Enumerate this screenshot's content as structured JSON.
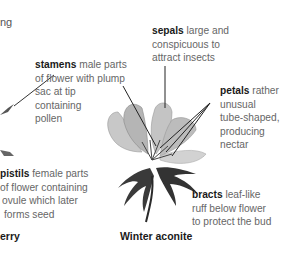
{
  "fragment_left_top": "ng",
  "labels": {
    "stamens": {
      "term": "stamens",
      "desc_lines": [
        " male parts",
        "of flower with plump",
        "sac at tip",
        "containing",
        "pollen"
      ]
    },
    "sepals": {
      "term": "sepals",
      "desc_lines": [
        " large and",
        "conspicuous to",
        "attract insects"
      ]
    },
    "petals": {
      "term": "petals",
      "desc_lines": [
        " rather",
        "unusual",
        "tube-shaped,",
        "producing",
        "nectar"
      ]
    },
    "pistils": {
      "term": "pistils",
      "desc_lines": [
        " female parts",
        "of flower containing",
        "ovule which later",
        "forms seed"
      ]
    },
    "bracts": {
      "term": "bracts",
      "desc_lines": [
        " leaf-like",
        "ruff below flower",
        "to protect the bud"
      ]
    }
  },
  "captions": {
    "left": "erry",
    "main": "Winter aconite"
  },
  "colors": {
    "term": "#1a1a1a",
    "desc": "#666666",
    "leader_line": "#222222",
    "petal": "#bdbdbd",
    "bract": "#3a3a3a"
  }
}
